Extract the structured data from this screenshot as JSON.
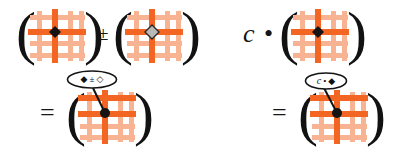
{
  "figure": {
    "background_color": "#ffffff",
    "ink_color": "#141414",
    "grid_light_color": "#f5a882",
    "grid_dark_color": "#f26522",
    "marker_fill_dark": "#141414",
    "marker_fill_light": "#b9b9b9"
  },
  "glyphs": {
    "open_paren": "(",
    "close_paren": ")",
    "plus_minus": "±",
    "equals": "=",
    "scalar_c": "c",
    "dot_operator": "•",
    "diamond_filled": "◆",
    "diamond_open": "◇"
  },
  "expressions": [
    {
      "id": "addition-expression",
      "label": "addition of two grid stencils",
      "row": "top-left",
      "terms": [
        {
          "kind": "paren-grid",
          "name": "grid-operand-a",
          "marker": "diamond_filled"
        },
        {
          "kind": "operator",
          "name": "plus-minus-operator",
          "glyph": "±"
        },
        {
          "kind": "paren-grid",
          "name": "grid-operand-b",
          "marker": "diamond_open"
        }
      ]
    },
    {
      "id": "scalar-expression",
      "label": "scalar multiple of a grid stencil",
      "row": "top-right",
      "terms": [
        {
          "kind": "scalar",
          "name": "scalar-symbol",
          "glyph": "c"
        },
        {
          "kind": "operator",
          "name": "dot-operator",
          "glyph": "•"
        },
        {
          "kind": "paren-grid",
          "name": "grid-operand-c",
          "marker": "diamond_filled"
        }
      ]
    },
    {
      "id": "addition-result",
      "label": "result of grid stencil addition",
      "row": "bottom-left",
      "terms": [
        {
          "kind": "operator",
          "name": "equals-operator-left",
          "glyph": "="
        },
        {
          "kind": "paren-grid",
          "name": "grid-result-sum",
          "marker": "diamond_filled"
        }
      ],
      "callout": {
        "name": "callout-sum",
        "items": [
          {
            "name": "callout-diamond-filled",
            "glyph": "◆",
            "style": "filled"
          },
          {
            "name": "callout-plus-minus",
            "glyph": "±",
            "style": "text"
          },
          {
            "name": "callout-diamond-open",
            "glyph": "◇",
            "style": "open"
          }
        ]
      }
    },
    {
      "id": "scalar-result",
      "label": "result of scalar multiplication",
      "row": "bottom-right",
      "terms": [
        {
          "kind": "operator",
          "name": "equals-operator-right",
          "glyph": "="
        },
        {
          "kind": "paren-grid",
          "name": "grid-result-scaled",
          "marker": "diamond_filled"
        }
      ],
      "callout": {
        "name": "callout-scaled",
        "items": [
          {
            "name": "callout-scalar-c",
            "glyph": "c",
            "style": "italic"
          },
          {
            "name": "callout-dot",
            "glyph": "•",
            "style": "text"
          },
          {
            "name": "callout-diamond-filled-2",
            "glyph": "◆",
            "style": "filled"
          }
        ]
      }
    }
  ]
}
